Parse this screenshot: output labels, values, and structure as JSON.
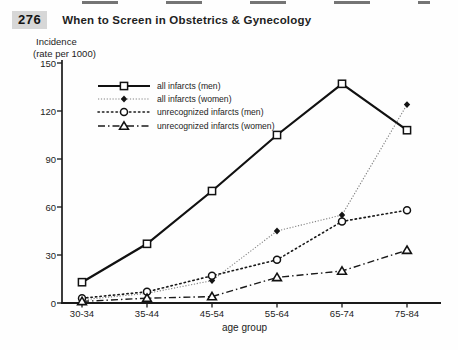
{
  "header": {
    "page_number": "276",
    "title": "When to Screen in Obstetrics & Gynecology"
  },
  "chart_data": {
    "type": "line",
    "title": "",
    "ylabel_line1": "Incidence",
    "ylabel_line2": "(rate per 1000)",
    "xlabel": "age group",
    "categories": [
      "30-34",
      "35-44",
      "45-54",
      "55-64",
      "65-74",
      "75-84"
    ],
    "ylim": [
      0,
      150
    ],
    "yticks": [
      0,
      30,
      60,
      90,
      120,
      150
    ],
    "grid": false,
    "legend_position": "top-left-inside",
    "series": [
      {
        "name": "all infarcts (men)",
        "marker": "square-open",
        "line_style": "solid",
        "color": "#111111",
        "values": [
          13,
          37,
          70,
          105,
          137,
          108
        ]
      },
      {
        "name": "all infarcts (women)",
        "marker": "diamond-filled",
        "line_style": "fine-dot",
        "color": "#808080",
        "values": [
          2,
          6,
          14,
          45,
          55,
          124
        ]
      },
      {
        "name": "unrecognized infarcts (men)",
        "marker": "circle-open",
        "line_style": "dotted",
        "color": "#1a1a1a",
        "values": [
          3,
          7,
          17,
          27,
          51,
          58
        ]
      },
      {
        "name": "unrecognized infarcts (women)",
        "marker": "triangle-open",
        "line_style": "dash-dot",
        "color": "#1a1a1a",
        "values": [
          1,
          3,
          4,
          16,
          20,
          33
        ]
      }
    ]
  }
}
